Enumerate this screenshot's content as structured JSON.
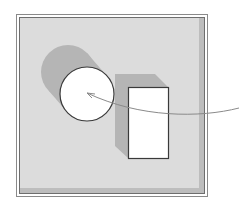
{
  "diagram": {
    "colors": {
      "background": "#ffffff",
      "panel_fill": "#dcdcdc",
      "panel_shadow": "#bdbdbd",
      "frame_stroke": "#808080",
      "shape_fill": "#ffffff",
      "shape_stroke": "#3a3a3a",
      "cast_shadow": "#b5b5b5",
      "arrow_stroke": "#8a8a8a"
    },
    "shapes": [
      {
        "type": "circle",
        "label": "circle",
        "cx": 87,
        "cy": 94,
        "r": 27
      },
      {
        "type": "rectangle",
        "label": "rectangle",
        "x": 128,
        "y": 87,
        "width": 40,
        "height": 71
      }
    ],
    "arrow": {
      "from": [
        239,
        108
      ],
      "to": [
        87,
        93
      ],
      "style": "curved"
    }
  }
}
